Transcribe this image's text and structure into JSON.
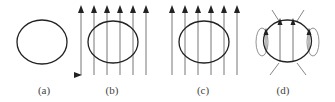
{
  "figure": {
    "panels": [
      {
        "id": "a",
        "label": "(a)",
        "description": "Conductor ring alone, no magnetic field",
        "label_x": 44
      },
      {
        "id": "b",
        "label": "(b)",
        "description": "Ring in uniform upward magnetic field, field lines pass through",
        "label_x": 112
      },
      {
        "id": "c",
        "label": "(c)",
        "description": "Ring in uniform upward magnetic field (same arrangement)",
        "label_x": 203
      },
      {
        "id": "d",
        "label": "(d)",
        "description": "Superconducting ring: field lines expelled/curved around edges with loops",
        "label_x": 283
      }
    ],
    "colors": {
      "ring": "#222222",
      "field_line": "#666666",
      "loop": "#777777",
      "label": "#444444"
    }
  }
}
